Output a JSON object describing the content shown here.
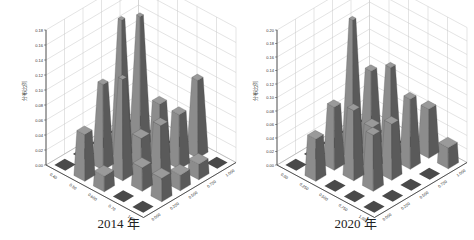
{
  "figure": {
    "panels": [
      {
        "caption": "2014 年"
      },
      {
        "caption": "2020 年"
      }
    ]
  },
  "colors": {
    "bar_top": "#9a9a9a",
    "bar_front": "#8c8c8c",
    "bar_side": "#5a5a5a",
    "floor_square": "#4a4a4a",
    "grid": "#c8c8c8",
    "axis": "#333333"
  },
  "chart_data": [
    {
      "type": "bar3d",
      "title": "2014 年",
      "ylabel": "分布比例",
      "zlim": [
        0,
        0.18
      ],
      "z_ticks": [
        "0.00",
        "0.02",
        "0.04",
        "0.06",
        "0.08",
        "0.10",
        "0.12",
        "0.14",
        "0.16",
        "0.18"
      ],
      "x_ticks": [
        "0.40",
        "0.50",
        "0.600",
        "0.70",
        "1.00"
      ],
      "y_ticks": [
        "0.000",
        "0.250",
        "0.500",
        "0.750",
        "1.000"
      ],
      "values": [
        [
          0.0,
          0.0,
          0.0,
          0.0,
          0.0
        ],
        [
          0.06,
          0.11,
          0.18,
          0.17,
          0.0
        ],
        [
          0.02,
          0.13,
          0.04,
          0.07,
          0.0
        ],
        [
          0.0,
          0.03,
          0.07,
          0.07,
          0.1
        ],
        [
          0.0,
          0.03,
          0.02,
          0.02,
          0.0
        ]
      ],
      "grid": true
    },
    {
      "type": "bar3d",
      "title": "2020 年",
      "ylabel": "分布比例",
      "zlim": [
        0,
        0.2
      ],
      "z_ticks": [
        "0.00",
        "0.02",
        "0.04",
        "0.06",
        "0.08",
        "0.10",
        "0.12",
        "0.14",
        "0.16",
        "0.18",
        "0.20"
      ],
      "x_ticks": [
        "0.00",
        "0.250",
        "0.500",
        "0.750",
        "1.00"
      ],
      "y_ticks": [
        "0.000",
        "0.250",
        "0.500",
        "0.750",
        "1.000"
      ],
      "values": [
        [
          0.0,
          0.0,
          0.0,
          0.0,
          0.0
        ],
        [
          0.06,
          0.09,
          0.2,
          0.11,
          0.0
        ],
        [
          0.0,
          0.1,
          0.06,
          0.13,
          0.0
        ],
        [
          0.0,
          0.08,
          0.08,
          0.1,
          0.07
        ],
        [
          0.0,
          0.0,
          0.0,
          0.0,
          0.03
        ]
      ],
      "grid": true
    }
  ]
}
